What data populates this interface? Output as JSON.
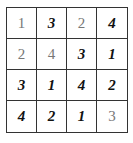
{
  "puzzle": {
    "size": 4,
    "rows": [
      [
        {
          "value": "1",
          "kind": "given"
        },
        {
          "value": "3",
          "kind": "filled"
        },
        {
          "value": "2",
          "kind": "given"
        },
        {
          "value": "4",
          "kind": "filled"
        }
      ],
      [
        {
          "value": "2",
          "kind": "given"
        },
        {
          "value": "4",
          "kind": "given"
        },
        {
          "value": "3",
          "kind": "filled"
        },
        {
          "value": "1",
          "kind": "filled"
        }
      ],
      [
        {
          "value": "3",
          "kind": "filled"
        },
        {
          "value": "1",
          "kind": "filled"
        },
        {
          "value": "4",
          "kind": "filled"
        },
        {
          "value": "2",
          "kind": "filled"
        }
      ],
      [
        {
          "value": "4",
          "kind": "filled"
        },
        {
          "value": "2",
          "kind": "filled"
        },
        {
          "value": "1",
          "kind": "filled"
        },
        {
          "value": "3",
          "kind": "given"
        }
      ]
    ]
  },
  "colors": {
    "grid_line": "#333333",
    "given_digit": "#777777",
    "filled_digit": "#111111",
    "background": "#ffffff"
  }
}
